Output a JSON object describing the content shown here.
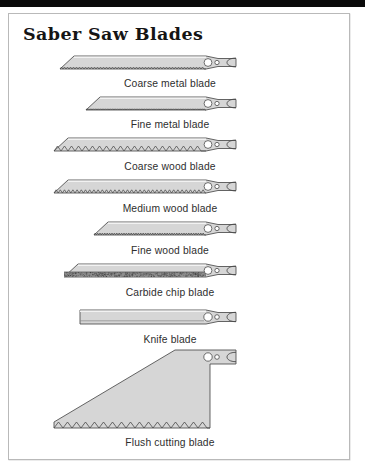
{
  "document": {
    "title": "Saber Saw Blades",
    "top_bar_color": "#0a0a0a",
    "border_color": "#b9b9b9",
    "background_color": "#ffffff"
  },
  "diagram": {
    "type": "illustration-set",
    "blade_fill": "#d6d6d6",
    "blade_outline": "#4a4a4a",
    "shank_feature": "two mounting holes and end notch",
    "blades": [
      {
        "id": "coarse-metal",
        "label": "Coarse metal blade",
        "edge": "fine-teeth",
        "tooth_pitch_px": 3.0,
        "tooth_depth_px": 2.0,
        "body_left_px": 60,
        "body_right_px": 236,
        "top_px": 56,
        "height_px": 13,
        "nose": "taper",
        "caption_y_px": 78
      },
      {
        "id": "fine-metal",
        "label": "Fine metal blade",
        "edge": "micro-teeth",
        "tooth_pitch_px": 1.7,
        "tooth_depth_px": 1.2,
        "body_left_px": 86,
        "body_right_px": 236,
        "top_px": 97,
        "height_px": 13,
        "nose": "taper",
        "caption_y_px": 119
      },
      {
        "id": "coarse-wood",
        "label": "Coarse wood blade",
        "edge": "large-teeth",
        "tooth_pitch_px": 7.0,
        "tooth_depth_px": 5.0,
        "body_left_px": 54,
        "body_right_px": 236,
        "top_px": 138,
        "height_px": 13,
        "nose": "taper",
        "caption_y_px": 161
      },
      {
        "id": "medium-wood",
        "label": "Medium wood blade",
        "edge": "medium-teeth",
        "tooth_pitch_px": 4.2,
        "tooth_depth_px": 3.2,
        "body_left_px": 54,
        "body_right_px": 236,
        "top_px": 180,
        "height_px": 13,
        "nose": "taper",
        "caption_y_px": 203
      },
      {
        "id": "fine-wood",
        "label": "Fine wood blade",
        "edge": "fine-teeth",
        "tooth_pitch_px": 2.4,
        "tooth_depth_px": 2.0,
        "body_left_px": 94,
        "body_right_px": 236,
        "top_px": 222,
        "height_px": 13,
        "nose": "taper",
        "caption_y_px": 245
      },
      {
        "id": "carbide-chip",
        "label": "Carbide chip blade",
        "edge": "carbide-grit",
        "grit_band_px": 5,
        "body_left_px": 64,
        "body_right_px": 236,
        "top_px": 264,
        "height_px": 13,
        "nose": "taper",
        "caption_y_px": 287
      },
      {
        "id": "knife",
        "label": "Knife blade",
        "edge": "smooth-bevel",
        "body_left_px": 80,
        "body_right_px": 236,
        "top_px": 310,
        "height_px": 14,
        "nose": "square",
        "caption_y_px": 334
      },
      {
        "id": "flush-cutting",
        "label": "Flush cutting blade",
        "edge": "large-teeth",
        "tooth_pitch_px": 9.0,
        "tooth_depth_px": 6.0,
        "body_left_px": 54,
        "body_right_px": 236,
        "top_px": 352,
        "height_px": 78,
        "nose": "wedge-offset",
        "caption_y_px": 437
      }
    ]
  }
}
